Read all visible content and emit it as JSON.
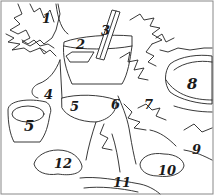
{
  "image": {
    "description": "Color-by-number line art of potted plants",
    "border_color": "#888888",
    "line_color": "#222222",
    "background": "#ffffff"
  },
  "labels": [
    {
      "id": "1",
      "text": "1",
      "x": 42,
      "y": 12,
      "size": 13
    },
    {
      "id": "2",
      "text": "2",
      "x": 76,
      "y": 38,
      "size": 13
    },
    {
      "id": "3",
      "text": "3",
      "x": 101,
      "y": 24,
      "size": 13
    },
    {
      "id": "4",
      "text": "4",
      "x": 44,
      "y": 88,
      "size": 13
    },
    {
      "id": "5a",
      "text": "5",
      "x": 70,
      "y": 100,
      "size": 13
    },
    {
      "id": "6",
      "text": "6",
      "x": 111,
      "y": 98,
      "size": 13
    },
    {
      "id": "7",
      "text": "7",
      "x": 144,
      "y": 98,
      "size": 13
    },
    {
      "id": "8",
      "text": "8",
      "x": 187,
      "y": 77,
      "size": 15
    },
    {
      "id": "5b",
      "text": "5",
      "x": 24,
      "y": 119,
      "size": 15
    },
    {
      "id": "9",
      "text": "9",
      "x": 192,
      "y": 143,
      "size": 13
    },
    {
      "id": "12",
      "text": "12",
      "x": 54,
      "y": 157,
      "size": 13
    },
    {
      "id": "10",
      "text": "10",
      "x": 158,
      "y": 164,
      "size": 13
    },
    {
      "id": "11",
      "text": "11",
      "x": 113,
      "y": 176,
      "size": 13
    }
  ]
}
